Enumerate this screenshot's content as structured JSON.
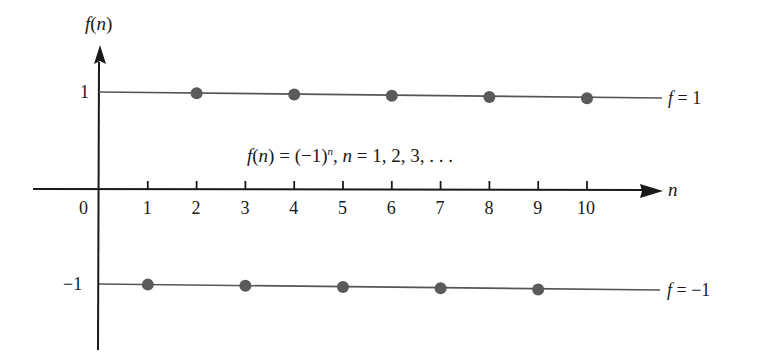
{
  "chart_data": {
    "type": "scatter",
    "title": "",
    "formula": "f(n) = (−1)ⁿ, n = 1, 2, 3, . . .",
    "xlabel": "n",
    "ylabel": "f(n)",
    "x_ticks": [
      1,
      2,
      3,
      4,
      5,
      6,
      7,
      8,
      9,
      10
    ],
    "x_origin_label": "0",
    "y_ticks": [
      1,
      -1
    ],
    "y_tick_labels": [
      "1",
      "−1"
    ],
    "xlim": [
      0,
      11
    ],
    "ylim": [
      -2,
      1.8
    ],
    "grid": false,
    "legend": "none",
    "series": [
      {
        "name": "f(n) = (−1)^n",
        "x": [
          1,
          2,
          3,
          4,
          5,
          6,
          7,
          8,
          9,
          10
        ],
        "y": [
          -1,
          1,
          -1,
          1,
          -1,
          1,
          -1,
          1,
          -1,
          1
        ]
      }
    ],
    "reference_lines": [
      {
        "y": 1,
        "label": "f = 1"
      },
      {
        "y": -1,
        "label": "f = −1"
      }
    ],
    "annotations": [
      "f(n) = (−1)ⁿ, n = 1, 2, 3, . . ."
    ]
  },
  "labels": {
    "y_axis": "f(n)",
    "x_axis": "n",
    "origin": "0",
    "y_pos": "1",
    "y_neg": "−1",
    "f_pos": "f = 1",
    "f_neg": "f = −1",
    "formula_f": "f(n) = (−1)",
    "formula_sup": "n",
    "formula_rest": ", n = 1, 2, 3, . . ."
  },
  "colors": {
    "axis": "#1a1a1a",
    "line": "#555555",
    "dot": "#5a5a5a"
  }
}
